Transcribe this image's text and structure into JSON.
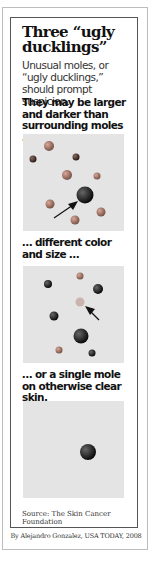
{
  "title": "Three “ugly ducklings”",
  "intro": "Unusual moles, or “ugly ducklings,” should prompt suspicion.",
  "panels": [
    {
      "caption": "They may be larger and darker than surrounding moles …"
    },
    {
      "caption": "… different color and size …"
    },
    {
      "caption": "… or a single mole on otherwise clear skin."
    }
  ],
  "source": "Source: The Skin Cancer Foundation",
  "credit": "By Alejandro Gonzalez, USA TODAY, 2008",
  "colors": {
    "panel_bg": "#e4e4e4",
    "mole_dark": "#1a1a1a",
    "mole_light": "#b07a6a"
  }
}
